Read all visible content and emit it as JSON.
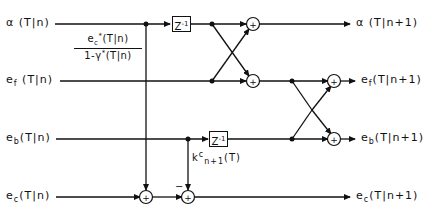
{
  "diagram": {
    "type": "lattice filter signal-flow diagram",
    "inputs": [
      {
        "symbol": "α",
        "arg": "(T|n)"
      },
      {
        "symbol": "e",
        "sub": "f",
        "arg": "(T|n)"
      },
      {
        "symbol": "e",
        "sub": "b",
        "arg": "(T|n)"
      },
      {
        "symbol": "e",
        "sub": "c",
        "arg": "(T|n)"
      }
    ],
    "outputs": [
      {
        "symbol": "α",
        "arg": "(T|n+1)"
      },
      {
        "symbol": "e",
        "sub": "f",
        "arg": "(T|n+1)"
      },
      {
        "symbol": "e",
        "sub": "b",
        "arg": "(T|n+1)"
      },
      {
        "symbol": "e",
        "sub": "c",
        "arg": "(T|n+1)"
      }
    ],
    "fraction": {
      "numerator": {
        "symbol": "e",
        "sub": "c",
        "sup": "*",
        "arg": "(T|n)"
      },
      "denominator": {
        "prefix": "1-",
        "symbol": "γ",
        "sup": "*",
        "arg": "(T|n)"
      }
    },
    "coefficient": {
      "symbol": "k",
      "sup": "c",
      "sub": "n+1",
      "arg": "(T)"
    },
    "delay_label": {
      "base": "Z",
      "exp": "-1"
    },
    "adder_symbol": "+",
    "minus_sign": "−"
  }
}
